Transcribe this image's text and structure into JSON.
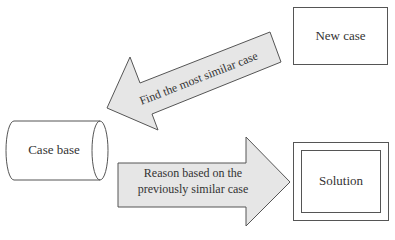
{
  "diagram": {
    "type": "flow",
    "colors": {
      "stroke": "#555555",
      "arrow_fill": "#e6e6e6",
      "background": "#ffffff",
      "text": "#333333"
    },
    "nodes": {
      "new_case": {
        "label": "New case",
        "shape": "rectangle"
      },
      "case_base": {
        "label": "Case base",
        "shape": "cylinder"
      },
      "solution": {
        "label": "Solution",
        "shape": "double-rectangle"
      }
    },
    "edges": {
      "retrieve": {
        "from": "new_case",
        "to": "case_base",
        "label": "Find the most similar case",
        "shape": "block-arrow"
      },
      "reuse": {
        "from": "case_base",
        "to": "solution",
        "label_line1": "Reason based on the",
        "label_line2": "previously similar case",
        "shape": "block-arrow"
      }
    }
  }
}
